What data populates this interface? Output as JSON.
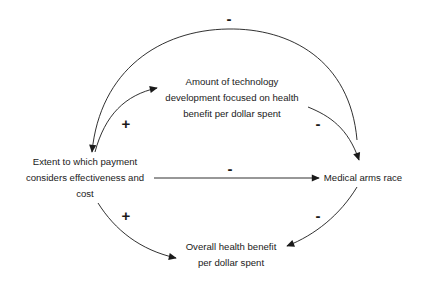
{
  "diagram": {
    "type": "causal-loop",
    "nodes": {
      "tech": [
        "Amount of technology",
        "development focused on health",
        "benefit per dollar spent"
      ],
      "payment": [
        "Extent to which payment",
        "considers effectiveness and",
        "cost"
      ],
      "arms": [
        "Medical arms race"
      ],
      "overall": [
        "Overall health benefit",
        "per dollar spent"
      ]
    },
    "links": [
      {
        "from": "Medical arms race",
        "to": "Extent to which payment considers effectiveness and cost",
        "polarity": "-"
      },
      {
        "from": "Extent to which payment considers effectiveness and cost",
        "to": "Amount of technology development focused on health benefit per dollar spent",
        "polarity": "+"
      },
      {
        "from": "Amount of technology development focused on health benefit per dollar spent",
        "to": "Medical arms race",
        "polarity": "-"
      },
      {
        "from": "Extent to which payment considers effectiveness and cost",
        "to": "Medical arms race",
        "polarity": "-"
      },
      {
        "from": "Extent to which payment considers effectiveness and cost",
        "to": "Overall health benefit per dollar spent",
        "polarity": "+"
      },
      {
        "from": "Medical arms race",
        "to": "Overall health benefit per dollar spent",
        "polarity": "-"
      }
    ],
    "polarity_labels": {
      "top_arc": "-",
      "payment_to_tech": "+",
      "tech_to_arms": "-",
      "payment_to_arms": "-",
      "payment_to_overall": "+",
      "arms_to_overall": "-"
    },
    "colors": {
      "line": "#1a1a1a",
      "background": "#ffffff"
    }
  }
}
